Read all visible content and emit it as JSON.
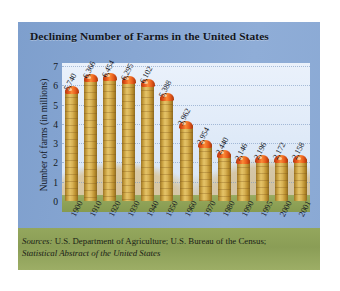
{
  "figure": {
    "title": "Declining Number of Farms in the United States",
    "source_prefix": "Sources:",
    "source_line1": " U.S. Department of Agriculture; U.S. Bureau of the Census;",
    "source_line2": "Statistical Abstract of the United States",
    "colors": {
      "frame_blue": "#8aa9d4",
      "sky": "#e2ecf9",
      "grass": "#8fa257",
      "silo_body": "#d8b254",
      "silo_cap": "#e2511a",
      "source_band": "#8a9d56"
    }
  },
  "chart_data": {
    "type": "bar",
    "title": "Declining Number of Farms in the United States",
    "xlabel": "Year",
    "ylabel": "Number of farms (in millions)",
    "ylim": [
      0,
      7
    ],
    "yticks": [
      0,
      1,
      2,
      3,
      4,
      5,
      6,
      7
    ],
    "ytick_labels": [
      "0",
      "1",
      "2",
      "3",
      "4",
      "5",
      "6",
      "7"
    ],
    "grid": "horizontal-dotted",
    "legend": "none",
    "units_note": "bar labels are in thousands of farms",
    "categories": [
      "1900",
      "1910",
      "1920",
      "1930",
      "1940",
      "1950",
      "1960",
      "1970",
      "1980",
      "1990",
      "1995",
      "2000",
      "2001"
    ],
    "values": [
      5.74,
      6.366,
      6.454,
      6.295,
      6.102,
      5.388,
      3.962,
      2.954,
      2.44,
      2.146,
      2.196,
      2.172,
      2.158
    ],
    "data_labels": [
      "5,740",
      "6,366",
      "6,454",
      "6,295",
      "6,102",
      "5,388",
      "3,962",
      "2,954",
      "2,440",
      "2,146",
      "2,196",
      "2,172",
      "2,158"
    ]
  }
}
